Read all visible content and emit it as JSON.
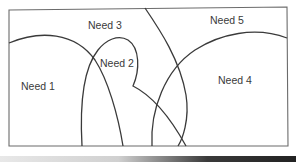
{
  "diagram": {
    "type": "venn-style overlapping needs",
    "frame_color": "#6b6b6b",
    "stroke_color": "#3a3a3a",
    "labels": [
      {
        "id": "need1",
        "text": "Need 1"
      },
      {
        "id": "need2",
        "text": "Need 2"
      },
      {
        "id": "need3",
        "text": "Need 3"
      },
      {
        "id": "need4",
        "text": "Need 4"
      },
      {
        "id": "need5",
        "text": "Need 5"
      }
    ]
  }
}
